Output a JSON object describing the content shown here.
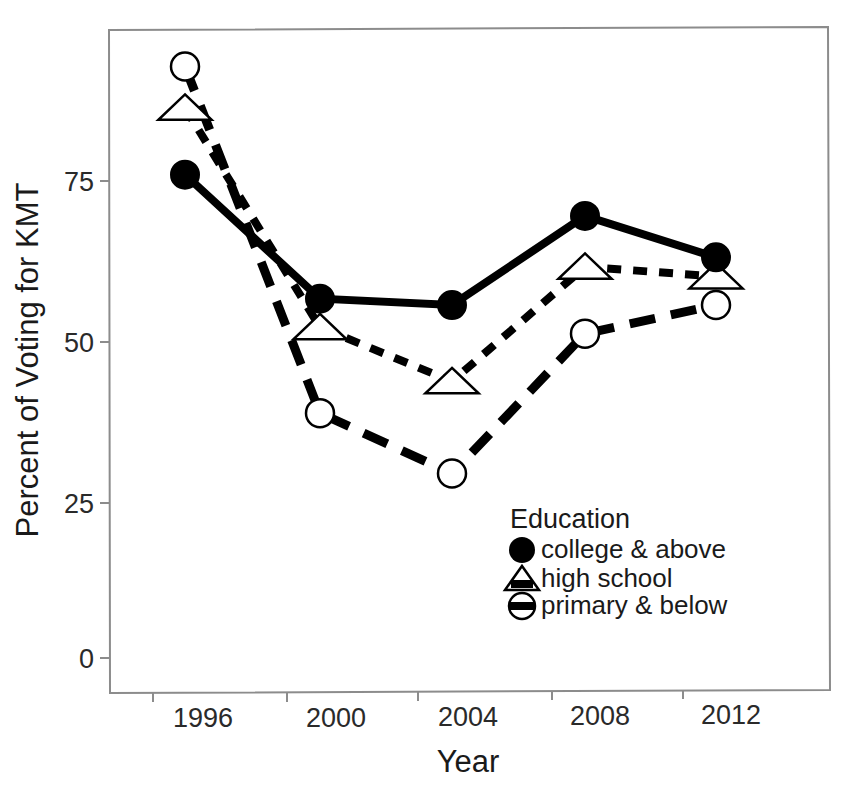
{
  "header": {
    "faint_running_text": ""
  },
  "chart_data": {
    "type": "line",
    "title": "",
    "xlabel": "Year",
    "ylabel": "Percent of Voting for KMT",
    "categories": [
      "1996",
      "2000",
      "2004",
      "2008",
      "2012"
    ],
    "x": [
      1996,
      2000,
      2004,
      2008,
      2012
    ],
    "xtick_labels": [
      "1996",
      "2000",
      "2004",
      "2008",
      "2012"
    ],
    "ytick_labels": [
      "0",
      "25",
      "50",
      "75"
    ],
    "yticks": [
      0,
      25,
      50,
      75
    ],
    "ylim": [
      -3,
      103
    ],
    "xlim": [
      1994.6,
      2014.4
    ],
    "grid": false,
    "legend_position": "inside-bottom-right",
    "legend_title": "Education",
    "series": [
      {
        "name": "college & above",
        "values": [
          76,
          56.5,
          55.5,
          69.5,
          63
        ],
        "marker": "filled-circle",
        "linestyle": "solid",
        "color": "#000000"
      },
      {
        "name": "high school",
        "values": [
          86.5,
          52,
          43.5,
          61.5,
          60
        ],
        "marker": "open-triangle",
        "linestyle": "short-dash",
        "color": "#000000"
      },
      {
        "name": "primary & below",
        "values": [
          93,
          38.5,
          29,
          51,
          55.5
        ],
        "marker": "open-circle-bar",
        "linestyle": "long-dash",
        "color": "#000000"
      }
    ]
  },
  "legend": {
    "title": "Education",
    "entries": [
      {
        "label": "college & above",
        "marker": "filled-circle-icon"
      },
      {
        "label": "high school",
        "marker": "open-triangle-icon"
      },
      {
        "label": "primary & below",
        "marker": "open-circle-bar-icon"
      }
    ]
  },
  "colors": {
    "ink": "#000000",
    "frame": "#8c8c8c",
    "background": "#ffffff"
  }
}
